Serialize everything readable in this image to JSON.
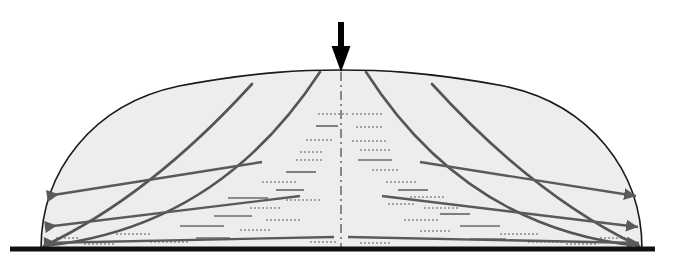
{
  "figure": {
    "name": "soil-dome-load-distribution-diagram",
    "title": "",
    "width": 677,
    "height": 272,
    "background_color": "#ffffff"
  },
  "colors": {
    "outline": "#1a1a1a",
    "fill": "#ededed",
    "flow_line": "#555555",
    "force_arrow": "#5a5a5a",
    "load_arrow": "#000000",
    "baseline": "#111111",
    "centerline": "#444444",
    "hatch_solid": "#6b6b6b",
    "hatch_dotted": "#8a8a8a"
  },
  "dome": {
    "name": "soil-mass-dome",
    "description": "Symmetric dome shaped soil mass",
    "left_base_x": 41,
    "right_base_x": 642,
    "base_y": 249,
    "apex_x": 341,
    "apex_y": 70,
    "fill": "#ededed",
    "stroke": "#1a1a1a",
    "stroke_width": 1.6
  },
  "baseline": {
    "name": "rigid-base-line",
    "x1": 10,
    "x2": 655,
    "y": 249,
    "thickness": 5,
    "color": "#111111"
  },
  "load_arrow": {
    "name": "applied-load-arrow",
    "direction": "down",
    "x": 341,
    "y_start": 22,
    "y_end": 72,
    "shaft_width": 6,
    "head_width": 19,
    "head_length": 26,
    "color": "#000000"
  },
  "centerline": {
    "name": "axis-of-symmetry",
    "x": 341,
    "y_start": 72,
    "y_end": 249,
    "pattern": "dash-dot",
    "color": "#444444",
    "width": 1.2
  },
  "flow_lines": [
    {
      "name": "flow-line-outer-left",
      "side": "left",
      "top_x": 252,
      "top_y": 84,
      "bottom_x": 44,
      "bottom_y": 246,
      "control_x": 150,
      "control_y": 196
    },
    {
      "name": "flow-line-inner-left",
      "side": "left",
      "top_x": 320,
      "top_y": 72,
      "bottom_x": 44,
      "bottom_y": 246,
      "control_x": 218,
      "control_y": 228
    },
    {
      "name": "flow-line-inner-right",
      "side": "right",
      "top_x": 366,
      "top_y": 72,
      "bottom_x": 639,
      "bottom_y": 246,
      "control_x": 466,
      "control_y": 228
    },
    {
      "name": "flow-line-outer-right",
      "side": "right",
      "top_x": 432,
      "top_y": 84,
      "bottom_x": 639,
      "bottom_y": 246,
      "control_x": 534,
      "control_y": 196
    }
  ],
  "force_arrows": [
    {
      "name": "force-arrow-left-upper",
      "side": "left",
      "direction": "left",
      "tail_x": 262,
      "tail_y": 162,
      "tip_x": 47,
      "tip_y": 196
    },
    {
      "name": "force-arrow-left-middle",
      "side": "left",
      "direction": "left",
      "tail_x": 300,
      "tail_y": 196,
      "tip_x": 45,
      "tip_y": 227
    },
    {
      "name": "force-arrow-left-lower",
      "side": "left",
      "direction": "left",
      "tail_x": 334,
      "tail_y": 237,
      "tip_x": 44,
      "tip_y": 243
    },
    {
      "name": "force-arrow-right-upper",
      "side": "right",
      "direction": "right",
      "tail_x": 420,
      "tail_y": 162,
      "tip_x": 636,
      "tip_y": 196
    },
    {
      "name": "force-arrow-right-middle",
      "side": "right",
      "direction": "right",
      "tail_x": 382,
      "tail_y": 196,
      "tip_x": 638,
      "tip_y": 227
    },
    {
      "name": "force-arrow-right-lower",
      "side": "right",
      "direction": "right",
      "tail_x": 348,
      "tail_y": 237,
      "tip_x": 639,
      "tip_y": 243
    }
  ],
  "hatch_marks": [
    {
      "x": 318,
      "y": 114,
      "len": 30,
      "style": "dotted"
    },
    {
      "x": 352,
      "y": 114,
      "len": 30,
      "style": "dotted"
    },
    {
      "x": 316,
      "y": 126,
      "len": 22,
      "style": "solid"
    },
    {
      "x": 356,
      "y": 127,
      "len": 26,
      "style": "dotted"
    },
    {
      "x": 306,
      "y": 140,
      "len": 28,
      "style": "dotted"
    },
    {
      "x": 352,
      "y": 141,
      "len": 34,
      "style": "dotted"
    },
    {
      "x": 300,
      "y": 152,
      "len": 24,
      "style": "dotted"
    },
    {
      "x": 360,
      "y": 150,
      "len": 30,
      "style": "dotted"
    },
    {
      "x": 296,
      "y": 160,
      "len": 26,
      "style": "dotted"
    },
    {
      "x": 358,
      "y": 160,
      "len": 34,
      "style": "solid"
    },
    {
      "x": 286,
      "y": 172,
      "len": 30,
      "style": "solid"
    },
    {
      "x": 372,
      "y": 170,
      "len": 26,
      "style": "dotted"
    },
    {
      "x": 262,
      "y": 182,
      "len": 36,
      "style": "dotted"
    },
    {
      "x": 386,
      "y": 182,
      "len": 32,
      "style": "dotted"
    },
    {
      "x": 276,
      "y": 190,
      "len": 28,
      "style": "solid"
    },
    {
      "x": 398,
      "y": 190,
      "len": 30,
      "style": "solid"
    },
    {
      "x": 228,
      "y": 198,
      "len": 40,
      "style": "solid"
    },
    {
      "x": 410,
      "y": 197,
      "len": 36,
      "style": "dotted"
    },
    {
      "x": 286,
      "y": 200,
      "len": 34,
      "style": "dotted"
    },
    {
      "x": 388,
      "y": 204,
      "len": 28,
      "style": "dotted"
    },
    {
      "x": 250,
      "y": 208,
      "len": 32,
      "style": "dotted"
    },
    {
      "x": 424,
      "y": 208,
      "len": 34,
      "style": "dotted"
    },
    {
      "x": 214,
      "y": 216,
      "len": 38,
      "style": "solid"
    },
    {
      "x": 440,
      "y": 214,
      "len": 30,
      "style": "solid"
    },
    {
      "x": 266,
      "y": 220,
      "len": 34,
      "style": "dotted"
    },
    {
      "x": 404,
      "y": 220,
      "len": 36,
      "style": "dotted"
    },
    {
      "x": 180,
      "y": 226,
      "len": 44,
      "style": "solid"
    },
    {
      "x": 460,
      "y": 226,
      "len": 40,
      "style": "solid"
    },
    {
      "x": 240,
      "y": 230,
      "len": 30,
      "style": "dotted"
    },
    {
      "x": 420,
      "y": 231,
      "len": 32,
      "style": "dotted"
    },
    {
      "x": 116,
      "y": 234,
      "len": 36,
      "style": "dotted"
    },
    {
      "x": 500,
      "y": 234,
      "len": 38,
      "style": "dotted"
    },
    {
      "x": 196,
      "y": 238,
      "len": 34,
      "style": "solid"
    },
    {
      "x": 470,
      "y": 239,
      "len": 36,
      "style": "solid"
    },
    {
      "x": 150,
      "y": 242,
      "len": 40,
      "style": "dotted"
    },
    {
      "x": 528,
      "y": 242,
      "len": 34,
      "style": "dotted"
    },
    {
      "x": 84,
      "y": 244,
      "len": 30,
      "style": "dotted"
    },
    {
      "x": 566,
      "y": 244,
      "len": 32,
      "style": "dotted"
    },
    {
      "x": 310,
      "y": 242,
      "len": 28,
      "style": "dotted"
    },
    {
      "x": 360,
      "y": 243,
      "len": 30,
      "style": "dotted"
    },
    {
      "x": 600,
      "y": 238,
      "len": 26,
      "style": "dotted"
    },
    {
      "x": 56,
      "y": 238,
      "len": 24,
      "style": "dotted"
    }
  ]
}
